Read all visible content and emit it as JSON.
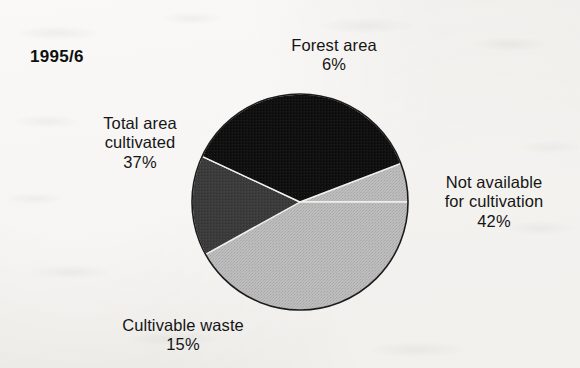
{
  "year_label": "1995/6",
  "chart_data": {
    "type": "pie",
    "title": "1995/6",
    "categories": [
      "Forest area",
      "Not available for cultivation",
      "Cultivable waste",
      "Total area cultivated"
    ],
    "values": [
      6,
      42,
      15,
      37
    ],
    "unit": "%",
    "legend": "labels-outside",
    "start_angle_deg": -21,
    "direction": "clockwise",
    "colors": [
      "#b6b6b6",
      "#b6b6b6",
      "#3b3b3b",
      "#121212"
    ],
    "separator_color": "#f2f0ec",
    "outline_color": "#1a1a1a",
    "slices": [
      {
        "label": "Forest area",
        "value": 6,
        "display": "6%",
        "color": "#b6b6b6",
        "start_deg": -21,
        "end_deg": 0
      },
      {
        "label": "Not available for cultivation",
        "value": 42,
        "display": "42%",
        "color": "#b6b6b6",
        "start_deg": 0,
        "end_deg": 151
      },
      {
        "label": "Cultivable waste",
        "value": 15,
        "display": "15%",
        "color": "#3b3b3b",
        "start_deg": 151,
        "end_deg": 205
      },
      {
        "label": "Total area cultivated",
        "value": 37,
        "display": "37%",
        "color": "#121212",
        "start_deg": 205,
        "end_deg": 339
      }
    ]
  },
  "labels": {
    "forest": {
      "line1": "Forest area",
      "value": "6%"
    },
    "not_available": {
      "line1": "Not available",
      "line2": "for cultivation",
      "value": "42%"
    },
    "cultivable_waste": {
      "line1": "Cultivable waste",
      "value": "15%"
    },
    "total_cultivated": {
      "line1": "Total area",
      "line2": "cultivated",
      "value": "37%"
    }
  }
}
